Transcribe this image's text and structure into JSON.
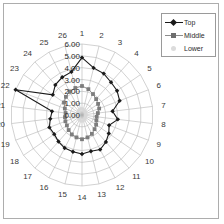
{
  "figure": {
    "border_color": "#adadad",
    "background": "#ffffff"
  },
  "legend": {
    "position": "top-right",
    "entries": [
      {
        "label": "Top",
        "color": "#1a1a1a",
        "marker": "diamond",
        "marker_name": "diamond-marker-icon"
      },
      {
        "label": "Middle",
        "color": "#7d7d7d",
        "marker": "square",
        "marker_name": "square-marker-icon"
      },
      {
        "label": "Lower",
        "color": "#d8d8d8",
        "marker": "dot",
        "marker_name": "dot-marker-icon"
      }
    ]
  },
  "chart_data": {
    "type": "line",
    "subtype": "radar",
    "title": "",
    "xlabel": "",
    "ylabel": "",
    "grid": true,
    "legend_position": "top-right",
    "rlim": [
      0.0,
      6.0
    ],
    "r_tick_labels": [
      "0.00",
      "1.00",
      "2.00",
      "3.00",
      "4.00",
      "5.00",
      "6.00"
    ],
    "r_ticks": [
      0,
      1,
      2,
      3,
      4,
      5,
      6
    ],
    "categories": [
      "1",
      "2",
      "3",
      "4",
      "5",
      "6",
      "7",
      "8",
      "9",
      "10",
      "11",
      "12",
      "13",
      "14",
      "15",
      "16",
      "17",
      "18",
      "19",
      "20",
      "21",
      "22",
      "23",
      "24",
      "25",
      "26"
    ],
    "series": [
      {
        "name": "Top",
        "color": "#1a1a1a",
        "marker": "diamond",
        "values": [
          4.85,
          4.1,
          3.95,
          3.7,
          3.6,
          3.4,
          2.6,
          3.05,
          2.45,
          2.75,
          3.05,
          3.3,
          3.15,
          3.3,
          3.2,
          3.15,
          3.0,
          2.85,
          2.95,
          2.7,
          2.55,
          6.0,
          3.0,
          3.4,
          3.6,
          3.75
        ]
      },
      {
        "name": "Middle",
        "color": "#7d7d7d",
        "marker": "square",
        "values": [
          2.45,
          2.25,
          2.0,
          1.8,
          1.65,
          1.55,
          1.35,
          1.25,
          1.3,
          1.45,
          1.6,
          1.8,
          1.95,
          2.05,
          1.95,
          1.85,
          1.7,
          1.55,
          1.5,
          1.45,
          1.4,
          1.55,
          1.85,
          2.05,
          2.25,
          2.35
        ]
      },
      {
        "name": "Lower",
        "color": "#d8d8d8",
        "marker": "dot",
        "values": [
          0.55,
          0.5,
          0.45,
          0.42,
          0.38,
          0.35,
          0.32,
          0.3,
          0.32,
          0.35,
          0.4,
          0.45,
          0.5,
          0.52,
          0.5,
          0.46,
          0.42,
          0.38,
          0.36,
          0.34,
          0.33,
          0.36,
          0.42,
          0.48,
          0.52,
          0.55
        ]
      }
    ]
  }
}
